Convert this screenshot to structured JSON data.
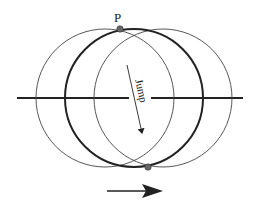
{
  "diagram": {
    "labels": {
      "point_label": "P",
      "jump_label": "Jump"
    },
    "colors": {
      "stroke": "#222222",
      "thin_stroke": "#444444",
      "point_fill": "#666666",
      "background": "#ffffff"
    },
    "circles": [
      {
        "name": "left-circle",
        "cx": 105,
        "cy": 98,
        "r": 69,
        "weight": "thin"
      },
      {
        "name": "center-circle",
        "cx": 134,
        "cy": 98,
        "r": 69,
        "weight": "bold"
      },
      {
        "name": "right-circle",
        "cx": 163,
        "cy": 98,
        "r": 69,
        "weight": "thin"
      }
    ],
    "points": [
      {
        "name": "point-p",
        "x": 120,
        "y": 29
      },
      {
        "name": "point-bottom",
        "x": 148,
        "y": 167
      }
    ],
    "axis": {
      "y": 98,
      "x_start": 17,
      "x_end": 243,
      "gap_start": 129,
      "gap_end": 151
    },
    "direction_arrow": {
      "x1": 107,
      "y1": 191,
      "x2": 163,
      "y2": 191
    }
  }
}
